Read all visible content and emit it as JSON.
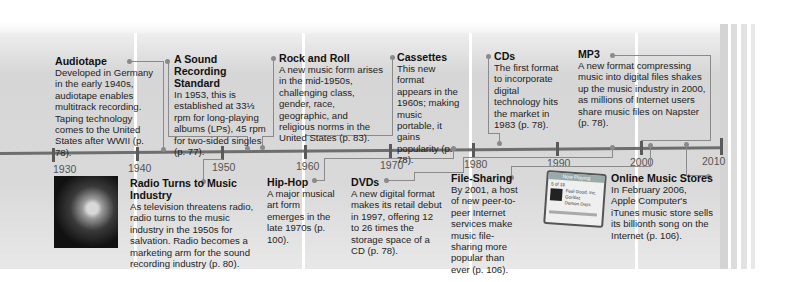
{
  "timeline": {
    "axis_years": [
      "1930",
      "1940",
      "1950",
      "1960",
      "1970",
      "1980",
      "1990",
      "2000",
      "2010"
    ],
    "colors": {
      "axis": "#6e6e6e",
      "band": "#d9d9d9",
      "connector": "#8a8a8a",
      "text": "#1e1e1e"
    }
  },
  "events_above": [
    {
      "title": "Audiotape",
      "body": "Developed in Germany in the early 1940s, audiotape enables multitrack recording. Taping technology comes to the United States after WWII (p. 78)."
    },
    {
      "title": "A Sound Recording Standard",
      "body": "In 1953, this is established at 33⅓ rpm for long-playing albums (LPs), 45 rpm for two-sided singles (p. 77)."
    },
    {
      "title": "Rock and Roll",
      "body": "A new music form arises in the mid-1950s, challenging class, gender, race, geographic, and religious norms in the United States (p. 83)."
    },
    {
      "title": "Cassettes",
      "body": "This new format appears in the 1960s; making music portable, it gains popularity (p. 78)."
    },
    {
      "title": "CDs",
      "body": "The first format to incorporate digital technology hits the market in 1983 (p. 78)."
    },
    {
      "title": "MP3",
      "body": "A new format compressing music into digital files shakes up the music industry in 2000, as millions of Internet users share music files on Napster (p. 78)."
    }
  ],
  "events_below": [
    {
      "title": "Radio Turns to Music Industry",
      "body": "As television threatens radio, radio turns to the music industry in the 1950s for salvation. Radio becomes a marketing arm for the sound recording industry (p. 80)."
    },
    {
      "title": "Hip-Hop",
      "body": "A major musical art form emerges in the late 1970s (p. 100)."
    },
    {
      "title": "DVDs",
      "body": "A new digital format makes its retail debut in 1997, offering 12 to 26 times the storage space of a CD (p. 78)."
    },
    {
      "title": "File-Sharing",
      "body": "By 2001, a host of new peer-to-peer Internet services make music file-sharing more popular than ever (p. 106)."
    },
    {
      "title": "Online Music Stores",
      "body": "In February 2006, Apple Computer's iTunes music store sells its billionth song on the Internet (p. 106)."
    }
  ],
  "images": {
    "photo": "black-and-white photo of a singer holding a microphone",
    "ipod": {
      "header": "Now Playing",
      "count": "5 of 15",
      "lines": [
        "Feel Good, Inc.",
        "Gorillaz",
        "Demon Days"
      ],
      "elapsed": "2:35",
      "total": "1:03"
    }
  }
}
